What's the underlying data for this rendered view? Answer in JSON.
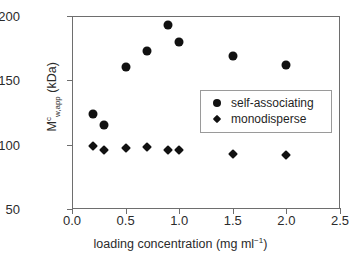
{
  "chart_data": {
    "type": "scatter",
    "title": "",
    "xlabel": "loading concentration (mg ml⁻¹)",
    "ylabel": "Mᶜ(w,app) (kDa)",
    "ylabel_parts": {
      "base": "M",
      "superscript": "c",
      "subscript": "w,app",
      "units": " (kDa)"
    },
    "xlim": [
      0.0,
      2.5
    ],
    "ylim": [
      50,
      200
    ],
    "xticks": [
      0.0,
      0.5,
      1.0,
      1.5,
      2.0,
      2.5
    ],
    "xtick_labels": [
      "0.0",
      "0.5",
      "1.0",
      "1.5",
      "2.0",
      "2.5"
    ],
    "yticks": [
      50,
      100,
      150,
      200
    ],
    "ytick_labels": [
      "50",
      "100",
      "150",
      "200"
    ],
    "grid": false,
    "legend_position": "center-right",
    "series": [
      {
        "name": "self-associating",
        "marker": "circle",
        "color": "#111111",
        "x": [
          0.2,
          0.3,
          0.5,
          0.7,
          0.9,
          1.0,
          1.5,
          2.0
        ],
        "values": [
          124,
          115,
          160,
          173,
          193,
          180,
          169,
          162
        ]
      },
      {
        "name": "monodisperse",
        "marker": "diamond",
        "color": "#111111",
        "x": [
          0.2,
          0.3,
          0.5,
          0.7,
          0.9,
          1.0,
          1.5,
          2.0
        ],
        "values": [
          99,
          96,
          97.5,
          98,
          96,
          95.5,
          93,
          92
        ]
      }
    ]
  },
  "legend": {
    "entries": [
      {
        "label": "self-associating",
        "marker": "circle"
      },
      {
        "label": "monodisperse",
        "marker": "diamond"
      }
    ]
  }
}
